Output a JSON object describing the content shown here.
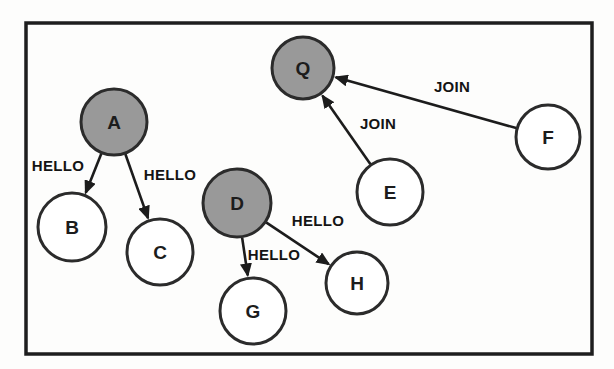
{
  "diagram": {
    "canvas": {
      "width": 614,
      "height": 369,
      "background": "#fdfdfc"
    },
    "frame": {
      "x": 26,
      "y": 23,
      "width": 566,
      "height": 331,
      "stroke": "#1e1e1e",
      "stroke_width": 3.5
    },
    "styles": {
      "node_fill_highlight": "#999999",
      "node_fill_plain": "#ffffff",
      "node_stroke": "#2b2b2b",
      "node_stroke_width": 3,
      "edge_color": "#1c1c1c",
      "edge_width": 2.6
    },
    "nodes": [
      {
        "id": "A",
        "label": "A",
        "x": 114,
        "y": 122,
        "r": 33,
        "filled": true
      },
      {
        "id": "B",
        "label": "B",
        "x": 72,
        "y": 227,
        "r": 34,
        "filled": false
      },
      {
        "id": "C",
        "label": "C",
        "x": 160,
        "y": 252,
        "r": 33,
        "filled": false
      },
      {
        "id": "D",
        "label": "D",
        "x": 237,
        "y": 203,
        "r": 34,
        "filled": true
      },
      {
        "id": "E",
        "label": "E",
        "x": 390,
        "y": 192,
        "r": 33,
        "filled": false
      },
      {
        "id": "F",
        "label": "F",
        "x": 548,
        "y": 137,
        "r": 32,
        "filled": false
      },
      {
        "id": "G",
        "label": "G",
        "x": 253,
        "y": 311,
        "r": 33,
        "filled": false
      },
      {
        "id": "H",
        "label": "H",
        "x": 357,
        "y": 283,
        "r": 31,
        "filled": false
      },
      {
        "id": "Q",
        "label": "Q",
        "x": 303,
        "y": 68,
        "r": 31,
        "filled": true
      }
    ],
    "edges": [
      {
        "from": "A",
        "to": "B",
        "label": "HELLO",
        "label_x": 58,
        "label_y": 166
      },
      {
        "from": "A",
        "to": "C",
        "label": "HELLO",
        "label_x": 170,
        "label_y": 175
      },
      {
        "from": "D",
        "to": "G",
        "label": "HELLO",
        "label_x": 274,
        "label_y": 255
      },
      {
        "from": "D",
        "to": "H",
        "label": "HELLO",
        "label_x": 318,
        "label_y": 221
      },
      {
        "from": "E",
        "to": "Q",
        "label": "JOIN",
        "label_x": 378,
        "label_y": 124
      },
      {
        "from": "F",
        "to": "Q",
        "label": "JOIN",
        "label_x": 452,
        "label_y": 87
      }
    ]
  }
}
